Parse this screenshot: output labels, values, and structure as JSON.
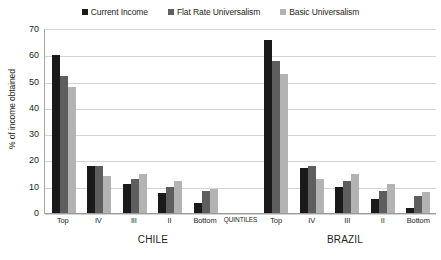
{
  "chart_data": {
    "type": "bar",
    "title": "",
    "subtitle": "",
    "xlabel": "QUINTILES",
    "ylabel": "% of income obtained",
    "ylim": [
      0,
      70
    ],
    "yticks": [
      0,
      10,
      20,
      30,
      40,
      50,
      60,
      70
    ],
    "grid": true,
    "legend_position": "top-center",
    "legend": [
      "Current Income",
      "Flat Rate Universalism",
      "Basic Universalism"
    ],
    "series_colors": [
      "#1a1a1a",
      "#5e5e5e",
      "#b3b3b3"
    ],
    "panels": [
      {
        "name": "CHILE",
        "categories": [
          "Top",
          "IV",
          "III",
          "II",
          "Bottom",
          "QUINTILES"
        ],
        "series": [
          {
            "name": "Current Income",
            "values": [
              60,
              18,
              11,
              7.5,
              4,
              null
            ]
          },
          {
            "name": "Flat Rate Universalism",
            "values": [
              52,
              18,
              13,
              10,
              8.5,
              null
            ]
          },
          {
            "name": "Basic Universalism",
            "values": [
              48,
              14,
              15,
              12,
              9,
              null
            ]
          }
        ]
      },
      {
        "name": "BRAZIL",
        "categories": [
          "Top",
          "IV",
          "III",
          "II",
          "Bottom"
        ],
        "series": [
          {
            "name": "Current Income",
            "values": [
              66,
              17,
              10,
              5.5,
              2
            ]
          },
          {
            "name": "Flat Rate Universalism",
            "values": [
              58,
              18,
              12,
              8.5,
              6.5
            ]
          },
          {
            "name": "Basic Universalism",
            "values": [
              53,
              13,
              15,
              11,
              8
            ]
          }
        ]
      }
    ]
  },
  "axis": {
    "y_label": "% of income obtained",
    "y_ticks": [
      "70",
      "60",
      "50",
      "40",
      "30",
      "20",
      "10",
      "0"
    ]
  },
  "legend": {
    "items": [
      {
        "label": "Current Income",
        "color": "#1a1a1a"
      },
      {
        "label": "Flat Rate Universalism",
        "color": "#5e5e5e"
      },
      {
        "label": "Basic Universalism",
        "color": "#b3b3b3"
      }
    ]
  },
  "xaxis": {
    "ticks": [
      "Top",
      "IV",
      "III",
      "II",
      "Bottom",
      "QUINTILES",
      "Top",
      "IV",
      "III",
      "II",
      "Bottom"
    ]
  },
  "countries": [
    {
      "label": "CHILE"
    },
    {
      "label": "BRAZIL"
    }
  ]
}
